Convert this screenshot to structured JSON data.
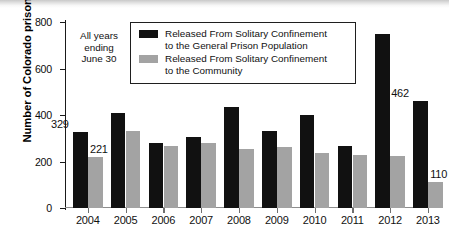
{
  "chart_data": {
    "type": "bar",
    "title": "",
    "xlabel": "",
    "ylabel": "Number of Colorado prisoners",
    "ylim": [
      0,
      800
    ],
    "yticks": [
      0,
      200,
      400,
      600,
      800
    ],
    "grid": false,
    "legend_position": "top-center",
    "categories": [
      "2004",
      "2005",
      "2006",
      "2007",
      "2008",
      "2009",
      "2010",
      "2011",
      "2012",
      "2013"
    ],
    "series": [
      {
        "name": "Released From Solitary Confinement to the General Prison Population",
        "color": "#111111",
        "values": [
          329,
          408,
          280,
          305,
          433,
          330,
          402,
          267,
          748,
          462
        ]
      },
      {
        "name": "Released From Solitary Confinement to the Community",
        "color": "#a3a3a3",
        "values": [
          221,
          333,
          265,
          278,
          254,
          261,
          236,
          228,
          222,
          110
        ]
      }
    ],
    "annotations": [
      {
        "text": "All years ending June 30",
        "position": "upper-left"
      },
      {
        "text": "329",
        "series": 0,
        "category": "2004"
      },
      {
        "text": "221",
        "series": 1,
        "category": "2004"
      },
      {
        "text": "462",
        "series": 0,
        "category": "2013"
      },
      {
        "text": "110",
        "series": 1,
        "category": "2013"
      }
    ]
  },
  "axis": {
    "y_title": "Number of Colorado prisoners",
    "y_ticks": [
      "800",
      "600",
      "400",
      "200",
      "0"
    ],
    "x_ticks": [
      "2004",
      "2005",
      "2006",
      "2007",
      "2008",
      "2009",
      "2010",
      "2011",
      "2012",
      "2013"
    ]
  },
  "annotation": {
    "line1": "All years",
    "line2": "ending",
    "line3": "June 30"
  },
  "legend": {
    "items": [
      {
        "color": "#111111",
        "line1": "Released From Solitary Confinement",
        "line2": "to the General Prison Population"
      },
      {
        "color": "#a3a3a3",
        "line1": "Released From Solitary Confinement",
        "line2": "to the Community"
      }
    ]
  },
  "data_labels": {
    "black_2004": "329",
    "gray_2004": "221",
    "black_2013": "462",
    "gray_2013": "110"
  }
}
